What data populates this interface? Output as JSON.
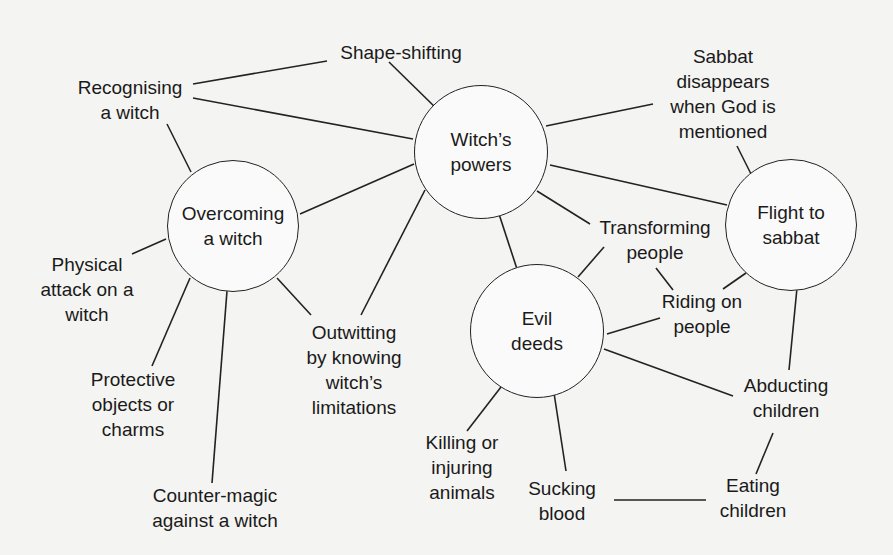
{
  "diagram": {
    "colors": {
      "background": "#f4f4f2",
      "line": "#222222",
      "text": "#1a1a1a"
    },
    "hubs": [
      {
        "id": "witchs_powers",
        "label": "Witch’s\npowers",
        "cx": 481,
        "cy": 152,
        "r": 67
      },
      {
        "id": "overcoming",
        "label": "Overcoming\na witch",
        "cx": 233,
        "cy": 226,
        "r": 66
      },
      {
        "id": "flight",
        "label": "Flight to\nsabbat",
        "cx": 791,
        "cy": 225,
        "r": 66
      },
      {
        "id": "evil_deeds",
        "label": "Evil\ndeeds",
        "cx": 537,
        "cy": 331,
        "r": 67
      }
    ],
    "leaves": [
      {
        "id": "shape_shifting",
        "label": "Shape-shifting",
        "x": 401,
        "y": 52
      },
      {
        "id": "recognising",
        "label": "Recognising\na witch",
        "x": 130,
        "y": 100
      },
      {
        "id": "sabbat_disappears",
        "label": "Sabbat\ndisappears\nwhen God is\nmentioned",
        "x": 723,
        "y": 94
      },
      {
        "id": "physical_attack",
        "label": "Physical\nattack on a\nwitch",
        "x": 87,
        "y": 289
      },
      {
        "id": "protective",
        "label": "Protective\nobjects or\ncharms",
        "x": 133,
        "y": 404
      },
      {
        "id": "counter_magic",
        "label": "Counter-magic\nagainst a witch",
        "x": 215,
        "y": 508
      },
      {
        "id": "outwitting",
        "label": "Outwitting\nby knowing\nwitch’s\nlimitations",
        "x": 354,
        "y": 370
      },
      {
        "id": "transforming",
        "label": "Transforming\npeople",
        "x": 655,
        "y": 240
      },
      {
        "id": "riding",
        "label": "Riding on\npeople",
        "x": 702,
        "y": 314
      },
      {
        "id": "abducting",
        "label": "Abducting\nchildren",
        "x": 786,
        "y": 398
      },
      {
        "id": "killing",
        "label": "Killing or\ninjuring\nanimals",
        "x": 462,
        "y": 467
      },
      {
        "id": "sucking",
        "label": "Sucking\nblood",
        "x": 562,
        "y": 501
      },
      {
        "id": "eating",
        "label": "Eating\nchildren",
        "x": 753,
        "y": 498
      }
    ],
    "edges": [
      {
        "from": "recognising",
        "to": "shape_shifting",
        "x1": 193,
        "y1": 84,
        "x2": 327,
        "y2": 61
      },
      {
        "from": "recognising",
        "to": "witchs_powers",
        "x1": 193,
        "y1": 98,
        "x2": 413,
        "y2": 139
      },
      {
        "from": "recognising",
        "to": "overcoming",
        "x1": 167,
        "y1": 124,
        "x2": 191,
        "y2": 172
      },
      {
        "from": "shape_shifting",
        "to": "witchs_powers",
        "x1": 389,
        "y1": 62,
        "x2": 438,
        "y2": 110
      },
      {
        "from": "witchs_powers",
        "to": "sabbat_disappears",
        "x1": 546,
        "y1": 126,
        "x2": 653,
        "y2": 104
      },
      {
        "from": "witchs_powers",
        "to": "flight",
        "x1": 550,
        "y1": 165,
        "x2": 727,
        "y2": 205
      },
      {
        "from": "witchs_powers",
        "to": "transforming",
        "x1": 537,
        "y1": 191,
        "x2": 590,
        "y2": 224
      },
      {
        "from": "witchs_powers",
        "to": "overcoming",
        "x1": 414,
        "y1": 164,
        "x2": 300,
        "y2": 214
      },
      {
        "from": "witchs_powers",
        "to": "outwitting",
        "x1": 425,
        "y1": 190,
        "x2": 361,
        "y2": 315
      },
      {
        "from": "witchs_powers",
        "to": "evil_deeds",
        "x1": 499,
        "y1": 214,
        "x2": 517,
        "y2": 269
      },
      {
        "from": "sabbat_disappears",
        "to": "flight",
        "x1": 737,
        "y1": 146,
        "x2": 751,
        "y2": 174
      },
      {
        "from": "overcoming",
        "to": "physical_attack",
        "x1": 166,
        "y1": 239,
        "x2": 132,
        "y2": 254
      },
      {
        "from": "overcoming",
        "to": "protective",
        "x1": 190,
        "y1": 278,
        "x2": 152,
        "y2": 366
      },
      {
        "from": "overcoming",
        "to": "counter_magic",
        "x1": 227,
        "y1": 291,
        "x2": 212,
        "y2": 483
      },
      {
        "from": "overcoming",
        "to": "outwitting",
        "x1": 277,
        "y1": 278,
        "x2": 311,
        "y2": 315
      },
      {
        "from": "evil_deeds",
        "to": "transforming",
        "x1": 578,
        "y1": 277,
        "x2": 604,
        "y2": 247
      },
      {
        "from": "transforming",
        "to": "riding",
        "x1": 656,
        "y1": 268,
        "x2": 673,
        "y2": 290
      },
      {
        "from": "evil_deeds",
        "to": "riding",
        "x1": 607,
        "y1": 334,
        "x2": 660,
        "y2": 318
      },
      {
        "from": "flight",
        "to": "riding",
        "x1": 746,
        "y1": 273,
        "x2": 723,
        "y2": 289
      },
      {
        "from": "flight",
        "to": "abducting",
        "x1": 797,
        "y1": 288,
        "x2": 789,
        "y2": 370
      },
      {
        "from": "evil_deeds",
        "to": "abducting",
        "x1": 604,
        "y1": 349,
        "x2": 733,
        "y2": 396
      },
      {
        "from": "evil_deeds",
        "to": "killing",
        "x1": 501,
        "y1": 387,
        "x2": 467,
        "y2": 431
      },
      {
        "from": "evil_deeds",
        "to": "sucking",
        "x1": 554,
        "y1": 393,
        "x2": 566,
        "y2": 471
      },
      {
        "from": "abducting",
        "to": "eating",
        "x1": 773,
        "y1": 433,
        "x2": 756,
        "y2": 474
      },
      {
        "from": "sucking",
        "to": "eating",
        "x1": 614,
        "y1": 500,
        "x2": 706,
        "y2": 500
      }
    ]
  }
}
